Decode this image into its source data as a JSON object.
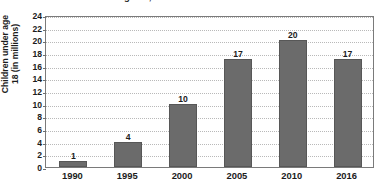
{
  "chart_data": {
    "type": "bar",
    "title": "Children under age 18, 1990-2016",
    "title_clipped": true,
    "xlabel": "",
    "ylabel_line1": "Children under age",
    "ylabel_line2": "18 (in millions)",
    "categories": [
      "1990",
      "1995",
      "2000",
      "2005",
      "2010",
      "2016"
    ],
    "values": [
      1,
      4,
      10,
      17,
      20,
      17
    ],
    "data_labels": [
      "1",
      "4",
      "10",
      "17",
      "20",
      "17"
    ],
    "ylim": [
      0,
      24
    ],
    "ytick_step": 2,
    "yticks": [
      "24",
      "22",
      "20",
      "18",
      "16",
      "14",
      "12",
      "10",
      "8",
      "6",
      "4",
      "2",
      "0"
    ],
    "grid": true,
    "grid_style": "dotted-horizontal",
    "legend": "none",
    "bar_color": "#6b6b6b",
    "bar_border_color": "#575757",
    "grid_color": "#b9b9b9",
    "axis_color": "#7a7a7a",
    "text_color": "#1c1c1c",
    "background": "#ffffff"
  }
}
